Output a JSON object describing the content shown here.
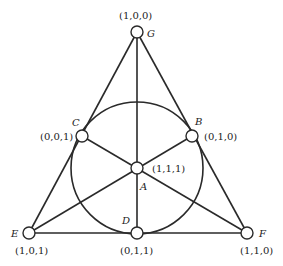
{
  "diagram": {
    "points": [
      {
        "name": "G",
        "coords": "(1,0,0)"
      },
      {
        "name": "C",
        "coords": "(0,0,1)"
      },
      {
        "name": "B",
        "coords": "(0,1,0)"
      },
      {
        "name": "A",
        "coords": "(1,1,1)"
      },
      {
        "name": "E",
        "coords": "(1,0,1)"
      },
      {
        "name": "D",
        "coords": "(0,1,1)"
      },
      {
        "name": "F",
        "coords": "(1,1,0)"
      }
    ]
  }
}
